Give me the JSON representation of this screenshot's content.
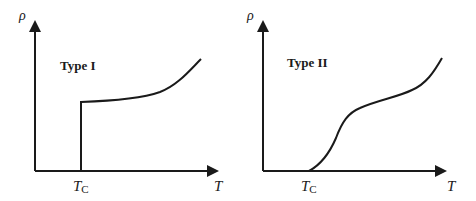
{
  "figure": {
    "panels": [
      {
        "id": "type-1",
        "title": "Type I",
        "y_axis_label": "ρ",
        "x_axis_label": "T",
        "critical_label": {
          "main": "T",
          "sub": "C"
        },
        "description": "Resistivity drops abruptly to zero at Tc"
      },
      {
        "id": "type-2",
        "title": "Type II",
        "y_axis_label": "ρ",
        "x_axis_label": "T",
        "critical_label": {
          "main": "T",
          "sub": "C"
        },
        "description": "Resistivity decreases smoothly to zero at Tc"
      }
    ],
    "colors": {
      "line": "#1a1a1a",
      "background": "#ffffff"
    }
  }
}
